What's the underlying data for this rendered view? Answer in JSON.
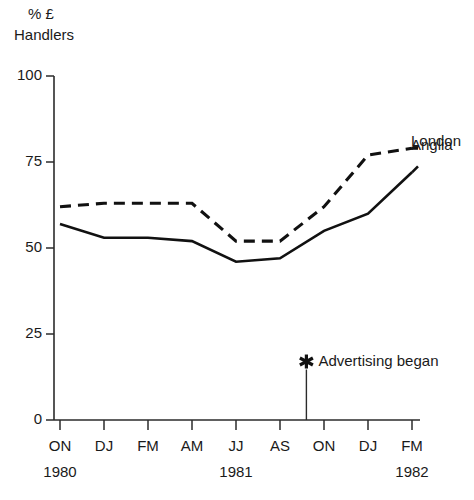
{
  "chart_data": {
    "type": "line",
    "title": "% £ Handlers",
    "title_line1": "% £",
    "title_line2": "Handlers",
    "xlabel": "",
    "ylabel": "",
    "ylim": [
      0,
      100
    ],
    "yticks": [
      0,
      25,
      50,
      75,
      100
    ],
    "ytick_labels": [
      "0",
      "25",
      "50",
      "75",
      "100"
    ],
    "grid": false,
    "legend_position": "right-inline",
    "categories": [
      "ON",
      "DJ",
      "FM",
      "AM",
      "JJ",
      "AS",
      "ON",
      "DJ",
      "FM"
    ],
    "year_groups": [
      {
        "label": "1980",
        "at_category_index": 0
      },
      {
        "label": "1981",
        "at_category_index": 4
      },
      {
        "label": "1982",
        "at_category_index": 8
      }
    ],
    "series": [
      {
        "name": "Anglia",
        "style": "dashed",
        "values": [
          62,
          63,
          63,
          63,
          52,
          52,
          62,
          77,
          79
        ]
      },
      {
        "name": "London",
        "style": "solid",
        "values": [
          57,
          53,
          53,
          52,
          46,
          47,
          55,
          60,
          72
        ]
      }
    ],
    "annotations": [
      {
        "text": "Advertising began",
        "marker": "asterisk",
        "at_category_index": 5.6,
        "y": 17
      }
    ]
  },
  "legend": {
    "anglia": "Anglia",
    "london": "London"
  },
  "annotation": {
    "label": "Advertising began",
    "marker_icon": "asterisk-icon"
  },
  "colors": {
    "ink": "#111111",
    "axis": "#2b2b2b",
    "background": "#ffffff"
  }
}
